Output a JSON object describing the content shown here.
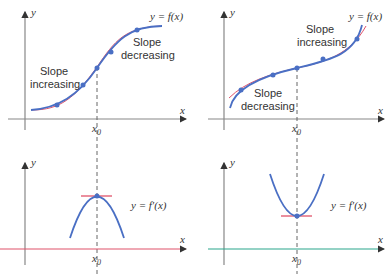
{
  "panels": [
    {
      "id": "top-left",
      "curve_label": "y = f(x)",
      "annotations": [
        "Slope",
        "increasing",
        "Slope",
        "decreasing"
      ],
      "x_axis": "x",
      "y_axis": "y",
      "x_tick": "x",
      "x_tick_sub": "0"
    },
    {
      "id": "top-right",
      "curve_label": "y = f(x)",
      "annotations": [
        "Slope",
        "increasing",
        "Slope",
        "decreasing"
      ],
      "x_axis": "x",
      "y_axis": "y",
      "x_tick": "x",
      "x_tick_sub": "0"
    },
    {
      "id": "bottom-left",
      "curve_label": "y = f′(x)",
      "x_axis": "x",
      "y_axis": "y",
      "x_tick": "x",
      "x_tick_sub": "0"
    },
    {
      "id": "bottom-right",
      "curve_label": "y = f′(x)",
      "x_axis": "x",
      "y_axis": "y",
      "x_tick": "x",
      "x_tick_sub": "0"
    }
  ],
  "colors": {
    "curve": "#4a6fc4",
    "tangent": "#e0526a",
    "axis": "#777777",
    "x_axis_bottom_left": "#e0526a",
    "x_axis_bottom_right": "#2aa58c"
  }
}
